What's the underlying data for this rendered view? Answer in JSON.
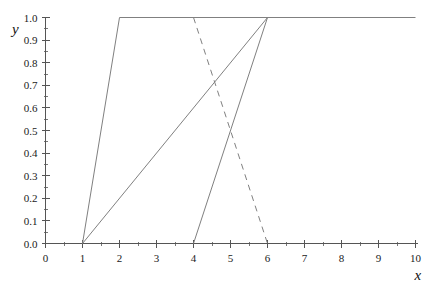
{
  "chart_data": {
    "type": "line",
    "title": "",
    "xlabel": "x",
    "ylabel": "y",
    "xlim": [
      0,
      10
    ],
    "ylim": [
      0.0,
      1.0
    ],
    "grid": false,
    "legend": "none",
    "x_ticks": [
      "0",
      "1",
      "2",
      "3",
      "4",
      "5",
      "6",
      "7",
      "8",
      "9",
      "10"
    ],
    "x_tick_values": [
      0,
      1,
      2,
      3,
      4,
      5,
      6,
      7,
      8,
      9,
      10
    ],
    "x_minor_tick_values": [
      0.5,
      1.5,
      2.5,
      3.5,
      4.5,
      5.5,
      6.5,
      7.5,
      8.5,
      9.5
    ],
    "y_ticks": [
      "0.0",
      "0.1",
      "0.2",
      "0.3",
      "0.4",
      "0.5",
      "0.6",
      "0.7",
      "0.8",
      "0.9",
      "1.0"
    ],
    "y_tick_values": [
      0.0,
      0.1,
      0.2,
      0.3,
      0.4,
      0.5,
      0.6,
      0.7,
      0.8,
      0.9,
      1.0
    ],
    "y_minor_tick_values": [
      0.05,
      0.15,
      0.25,
      0.35,
      0.45,
      0.55,
      0.65,
      0.75,
      0.85,
      0.95
    ],
    "line_color": "#808080",
    "axis_color": "#555555",
    "background_color": "#ffffff",
    "series": [
      {
        "name": "ramp-up-plateau",
        "style": "solid",
        "points": [
          [
            1,
            0.0
          ],
          [
            2,
            1.0
          ],
          [
            10,
            1.0
          ]
        ]
      },
      {
        "name": "slow-ramp-up",
        "style": "solid",
        "points": [
          [
            1,
            0.0
          ],
          [
            6,
            1.0
          ]
        ]
      },
      {
        "name": "late-ramp-up",
        "style": "solid",
        "points": [
          [
            4,
            0.0
          ],
          [
            6,
            1.0
          ]
        ]
      },
      {
        "name": "ramp-down-dashed",
        "style": "dashed",
        "points": [
          [
            4,
            1.0
          ],
          [
            6,
            0.0
          ]
        ]
      }
    ]
  }
}
